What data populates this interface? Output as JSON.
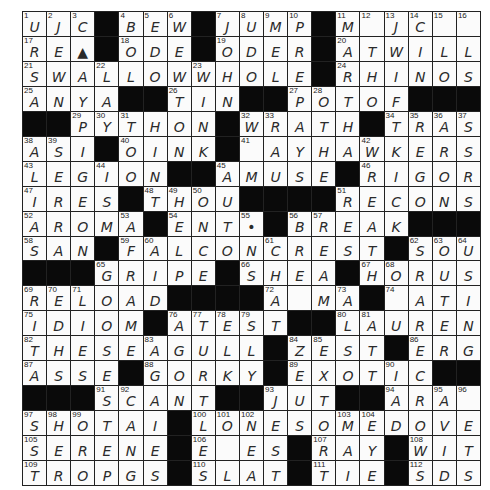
{
  "puzzle": {
    "rows": 19,
    "cols": 19,
    "grid": [
      [
        "U",
        "J",
        "C",
        "#",
        "B",
        "E",
        "W",
        "#",
        "J",
        "U",
        "M",
        "P",
        "#",
        "M",
        "",
        "J",
        "C",
        "",
        ""
      ],
      [
        "R",
        "E",
        "▲",
        "#",
        "O",
        "D",
        "E",
        "#",
        "O",
        "D",
        "E",
        "R",
        "#",
        "A",
        "T",
        "W",
        "I",
        "L",
        "L"
      ],
      [
        "S",
        "W",
        "A",
        "L",
        "L",
        "O",
        "W",
        "W",
        "H",
        "O",
        "L",
        "E",
        "#",
        "R",
        "H",
        "I",
        "N",
        "O",
        "S"
      ],
      [
        "A",
        "N",
        "Y",
        "A",
        "#",
        "#",
        "T",
        "I",
        "N",
        "#",
        "#",
        "P",
        "O",
        "T",
        "O",
        "F",
        "#",
        "#",
        "#"
      ],
      [
        "#",
        "#",
        "P",
        "Y",
        "T",
        "H",
        "O",
        "N",
        "#",
        "W",
        "R",
        "A",
        "T",
        "H",
        "#",
        "T",
        "R",
        "A",
        "S"
      ],
      [
        "A",
        "S",
        "I",
        "#",
        "O",
        "I",
        "N",
        "K",
        "#",
        "",
        "A",
        "Y",
        "H",
        "A",
        "W",
        "K",
        "E",
        "R",
        "S"
      ],
      [
        "L",
        "E",
        "G",
        "I",
        "O",
        "N",
        "#",
        "#",
        "A",
        "M",
        "U",
        "S",
        "E",
        "#",
        "R",
        "I",
        "G",
        "O",
        "R"
      ],
      [
        "I",
        "R",
        "E",
        "S",
        "#",
        "T",
        "H",
        "O",
        "U",
        "#",
        "#",
        "#",
        "#",
        "R",
        "E",
        "C",
        "O",
        "N",
        "S"
      ],
      [
        "A",
        "R",
        "O",
        "M",
        "A",
        "#",
        "E",
        "N",
        "T",
        "•",
        "#",
        "B",
        "R",
        "E",
        "A",
        "K",
        "#",
        "#",
        "#"
      ],
      [
        "S",
        "A",
        "N",
        "#",
        "F",
        "A",
        "L",
        "C",
        "O",
        "N",
        "C",
        "R",
        "E",
        "S",
        "T",
        "#",
        "S",
        "O",
        "U"
      ],
      [
        "#",
        "#",
        "#",
        "G",
        "R",
        "I",
        "P",
        "E",
        "#",
        "S",
        "H",
        "E",
        "A",
        "#",
        "H",
        "O",
        "R",
        "U",
        "S"
      ],
      [
        "R",
        "E",
        "L",
        "O",
        "A",
        "D",
        "#",
        "#",
        "#",
        "#",
        "A",
        "",
        "M",
        "A",
        "#",
        "",
        "A",
        "T",
        "I"
      ],
      [
        "I",
        "D",
        "I",
        "O",
        "M",
        "#",
        "A",
        "T",
        "E",
        "S",
        "T",
        "#",
        "#",
        "L",
        "A",
        "U",
        "R",
        "E",
        "N"
      ],
      [
        "T",
        "H",
        "E",
        "S",
        "E",
        "A",
        "G",
        "U",
        "L",
        "L",
        "#",
        "Z",
        "E",
        "S",
        "T",
        "#",
        "E",
        "R",
        "G"
      ],
      [
        "A",
        "S",
        "S",
        "E",
        "#",
        "G",
        "O",
        "R",
        "K",
        "Y",
        "#",
        "E",
        "X",
        "O",
        "T",
        "I",
        "C",
        "#",
        "#"
      ],
      [
        "#",
        "#",
        "#",
        "S",
        "C",
        "A",
        "N",
        "T",
        "#",
        "#",
        "J",
        "U",
        "T",
        "#",
        "#",
        "A",
        "R",
        "A",
        ""
      ],
      [
        "S",
        "H",
        "O",
        "T",
        "A",
        "I",
        "#",
        "L",
        "O",
        "N",
        "E",
        "S",
        "O",
        "M",
        "E",
        "D",
        "O",
        "V",
        "E"
      ],
      [
        "S",
        "E",
        "R",
        "E",
        "N",
        "E",
        "#",
        "E",
        "",
        "E",
        "S",
        "#",
        "R",
        "A",
        "Y",
        "#",
        "W",
        "I",
        "T"
      ],
      [
        "T",
        "R",
        "O",
        "P",
        "G",
        "S",
        "#",
        "S",
        "L",
        "A",
        "T",
        "#",
        "T",
        "I",
        "E",
        "#",
        "S",
        "D",
        "S"
      ]
    ],
    "numbers": [
      [
        1,
        2,
        3,
        0,
        4,
        5,
        6,
        0,
        7,
        8,
        9,
        10,
        0,
        11,
        12,
        13,
        14,
        15,
        16
      ],
      [
        17,
        0,
        0,
        0,
        18,
        0,
        0,
        0,
        19,
        0,
        0,
        0,
        0,
        20,
        0,
        0,
        0,
        0,
        0
      ],
      [
        21,
        0,
        0,
        22,
        0,
        0,
        0,
        23,
        0,
        0,
        0,
        0,
        0,
        24,
        0,
        0,
        0,
        0,
        0
      ],
      [
        25,
        0,
        0,
        0,
        0,
        0,
        26,
        0,
        0,
        0,
        0,
        27,
        28,
        0,
        0,
        0,
        0,
        0,
        0
      ],
      [
        0,
        0,
        29,
        30,
        31,
        0,
        0,
        0,
        0,
        32,
        33,
        0,
        0,
        0,
        0,
        34,
        35,
        36,
        37
      ],
      [
        38,
        39,
        0,
        0,
        40,
        0,
        0,
        0,
        0,
        41,
        0,
        0,
        0,
        0,
        42,
        0,
        0,
        0,
        0
      ],
      [
        43,
        0,
        0,
        44,
        0,
        0,
        0,
        0,
        45,
        0,
        0,
        0,
        0,
        0,
        46,
        0,
        0,
        0,
        0
      ],
      [
        47,
        0,
        0,
        0,
        0,
        48,
        49,
        50,
        0,
        0,
        0,
        0,
        0,
        51,
        0,
        0,
        0,
        0,
        0
      ],
      [
        52,
        0,
        0,
        0,
        53,
        0,
        54,
        0,
        0,
        55,
        0,
        56,
        57,
        0,
        0,
        0,
        0,
        0,
        0
      ],
      [
        58,
        0,
        0,
        0,
        59,
        60,
        0,
        0,
        0,
        0,
        61,
        0,
        0,
        0,
        0,
        0,
        62,
        63,
        64
      ],
      [
        0,
        0,
        0,
        65,
        0,
        0,
        0,
        0,
        0,
        66,
        0,
        0,
        0,
        0,
        67,
        68,
        0,
        0,
        0
      ],
      [
        69,
        70,
        71,
        0,
        0,
        0,
        0,
        0,
        0,
        0,
        72,
        0,
        0,
        73,
        0,
        74,
        0,
        0,
        0
      ],
      [
        75,
        0,
        0,
        0,
        0,
        0,
        76,
        77,
        78,
        79,
        0,
        0,
        0,
        80,
        81,
        0,
        0,
        0,
        0
      ],
      [
        82,
        0,
        0,
        0,
        0,
        83,
        0,
        0,
        0,
        0,
        0,
        84,
        85,
        0,
        0,
        0,
        86,
        0,
        0
      ],
      [
        87,
        0,
        0,
        0,
        0,
        88,
        0,
        0,
        0,
        0,
        0,
        89,
        0,
        0,
        0,
        90,
        0,
        0,
        0
      ],
      [
        0,
        0,
        0,
        91,
        92,
        0,
        0,
        0,
        0,
        0,
        93,
        0,
        0,
        0,
        0,
        94,
        0,
        95,
        96
      ],
      [
        97,
        98,
        99,
        0,
        0,
        0,
        0,
        100,
        101,
        102,
        0,
        0,
        0,
        103,
        104,
        0,
        0,
        0,
        0
      ],
      [
        105,
        0,
        0,
        0,
        0,
        0,
        0,
        106,
        0,
        0,
        0,
        0,
        107,
        0,
        0,
        0,
        108,
        0,
        0
      ],
      [
        109,
        0,
        0,
        0,
        0,
        0,
        0,
        110,
        0,
        0,
        0,
        0,
        111,
        0,
        0,
        0,
        112,
        0,
        0
      ]
    ]
  },
  "colors": {
    "black_cell": "#0a0a0a",
    "white_cell": "#fbfbfb",
    "ink": "#2a2a2a",
    "gridline": "#222222"
  }
}
